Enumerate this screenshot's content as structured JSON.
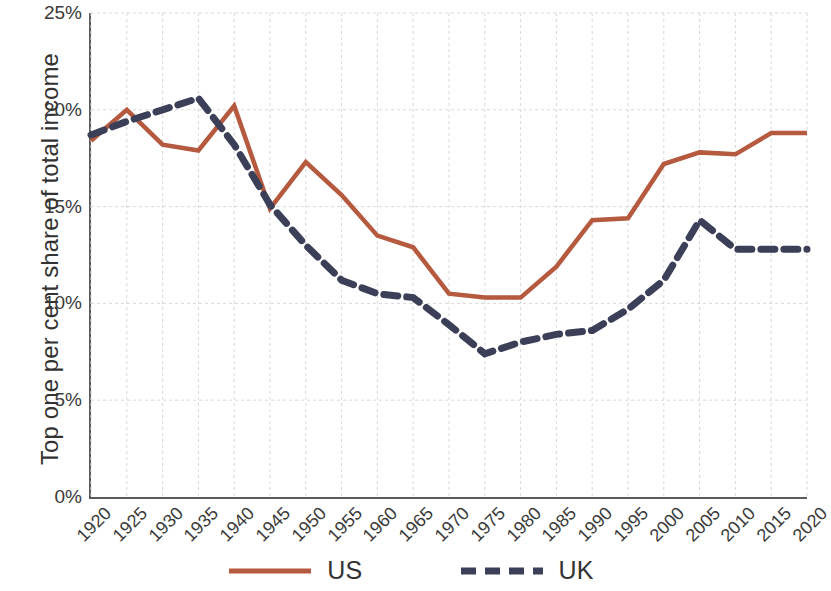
{
  "chart_data": {
    "type": "line",
    "title": "",
    "xlabel": "",
    "ylabel": "Top one per cent share of total income",
    "x": [
      1920,
      1925,
      1930,
      1935,
      1940,
      1945,
      1950,
      1955,
      1960,
      1965,
      1970,
      1975,
      1980,
      1985,
      1990,
      1995,
      2000,
      2005,
      2010,
      2015,
      2020
    ],
    "categories": [
      "1920",
      "1925",
      "1930",
      "1935",
      "1940",
      "1945",
      "1950",
      "1955",
      "1960",
      "1965",
      "1970",
      "1975",
      "1980",
      "1985",
      "1990",
      "1995",
      "2000",
      "2005",
      "2010",
      "2015",
      "2020"
    ],
    "series": [
      {
        "name": "US",
        "color": "#b5593f",
        "style": "solid",
        "values": [
          18.4,
          20.0,
          18.2,
          17.9,
          20.2,
          14.9,
          17.3,
          15.6,
          13.5,
          12.9,
          10.5,
          10.3,
          10.3,
          11.9,
          14.3,
          14.4,
          17.2,
          17.8,
          17.7,
          18.8,
          18.8
        ]
      },
      {
        "name": "UK",
        "color": "#3b3f58",
        "style": "dashed",
        "values": [
          18.7,
          19.4,
          20.0,
          20.6,
          18.2,
          15.1,
          13.0,
          11.2,
          10.5,
          10.3,
          8.9,
          7.4,
          8.0,
          8.4,
          8.6,
          9.7,
          11.2,
          14.3,
          12.8,
          12.8,
          12.8
        ]
      }
    ],
    "ylim": [
      0,
      25
    ],
    "ytick_values": [
      0,
      5,
      10,
      15,
      20,
      25
    ],
    "ytick_labels": [
      "0%",
      "5%",
      "10%",
      "15%",
      "20%",
      "25%"
    ],
    "xlim": [
      1920,
      2020
    ],
    "grid": true,
    "grid_color": "#d9d9d9",
    "legend_position": "bottom-center",
    "axis_color": "#5a5a5a",
    "background": "#ffffff"
  },
  "legend": {
    "entries": [
      {
        "label": "US"
      },
      {
        "label": "UK"
      }
    ]
  }
}
